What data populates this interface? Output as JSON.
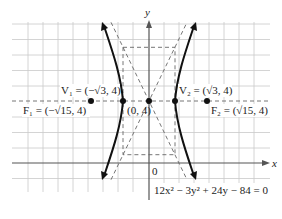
{
  "figure": {
    "equation": "12x² − 3y² + 24y − 84 = 0",
    "axes": {
      "x_label": "x",
      "y_label": "y",
      "origin_label": "0"
    },
    "center": {
      "label": "(0, 4)",
      "x": 0,
      "y": 4
    },
    "vertices": [
      {
        "name": "V",
        "sub": "1",
        "label": "V₁ = (−√3, 4)",
        "x": -1.732,
        "y": 4
      },
      {
        "name": "V",
        "sub": "2",
        "label": "V₂ = (√3, 4)",
        "x": 1.732,
        "y": 4
      }
    ],
    "foci": [
      {
        "name": "F",
        "sub": "1",
        "label": "F₁ = (−√15, 4)",
        "x": -3.873,
        "y": 4
      },
      {
        "name": "F",
        "sub": "2",
        "label": "F₂ = (√15, 4)",
        "x": 3.873,
        "y": 4
      }
    ],
    "hyperbola": {
      "a": 1.732,
      "b": 3.464,
      "orientation": "horizontal",
      "asymptote_slopes": [
        2,
        -2
      ]
    },
    "grid": {
      "x_min": -8,
      "x_max": 7,
      "y_min": -2,
      "y_max": 9,
      "unit": 1
    },
    "colors": {
      "curve": "#111111",
      "grid": "#c9c9c9",
      "dashed": "#666666"
    }
  }
}
